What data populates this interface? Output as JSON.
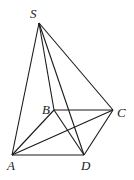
{
  "diagram": {
    "vertices": [
      {
        "id": "S",
        "label": "S"
      },
      {
        "id": "A",
        "label": "A"
      },
      {
        "id": "B",
        "label": "B"
      },
      {
        "id": "C",
        "label": "C"
      },
      {
        "id": "D",
        "label": "D"
      }
    ],
    "edges": [
      [
        "S",
        "A"
      ],
      [
        "S",
        "B"
      ],
      [
        "S",
        "C"
      ],
      [
        "S",
        "D"
      ],
      [
        "A",
        "B"
      ],
      [
        "B",
        "C"
      ],
      [
        "C",
        "D"
      ],
      [
        "A",
        "D"
      ],
      [
        "A",
        "C"
      ],
      [
        "B",
        "D"
      ]
    ],
    "line_color": "#1a1a1a",
    "line_style": "solid"
  }
}
